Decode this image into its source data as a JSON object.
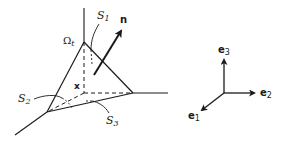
{
  "diagram": {
    "labels": {
      "S1": {
        "main": "S",
        "sub": "1"
      },
      "S2": {
        "main": "S",
        "sub": "2"
      },
      "S3": {
        "main": "S",
        "sub": "3"
      },
      "Omega": {
        "main": "Ω",
        "sub": "t"
      },
      "n": "n",
      "x": "x",
      "e1": {
        "main": "e",
        "sub": "1"
      },
      "e2": {
        "main": "e",
        "sub": "2"
      },
      "e3": {
        "main": "e",
        "sub": "3"
      }
    },
    "colors": {
      "stroke": "#1a1a1a",
      "background": "#ffffff"
    }
  }
}
